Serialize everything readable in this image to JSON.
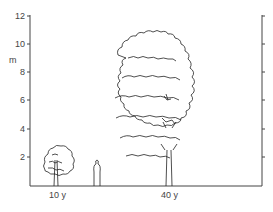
{
  "figure": {
    "y_axis": {
      "unit_label": "m",
      "ticks": [
        "12",
        "10",
        "8",
        "6",
        "4",
        "2"
      ]
    },
    "x_labels": [
      "10 y",
      "40 y"
    ],
    "elements": [
      {
        "name": "young-tree",
        "age": "10 y",
        "approx_height_m": 3.5
      },
      {
        "name": "human-figure",
        "approx_height_m": 1.8
      },
      {
        "name": "mature-tree",
        "age": "40 y",
        "approx_height_m": 11
      }
    ]
  }
}
